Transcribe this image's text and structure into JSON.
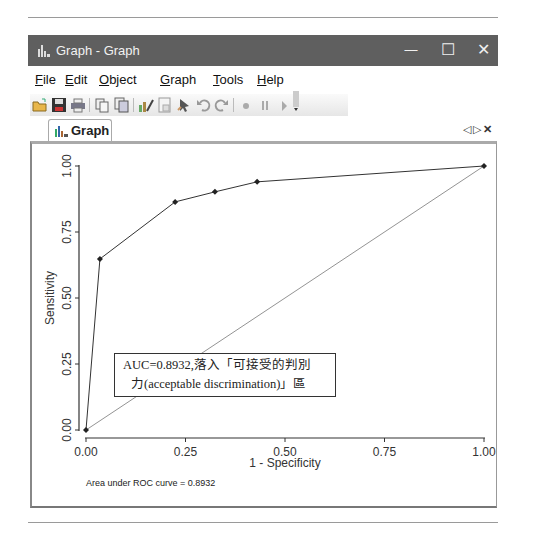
{
  "window": {
    "title": "Graph - Graph",
    "controls": {
      "minimize": "—",
      "maximize": "☐",
      "close": "✕"
    }
  },
  "menu": {
    "items": [
      {
        "label": "File",
        "mnemonic": "F",
        "rest": "ile"
      },
      {
        "label": "Edit",
        "mnemonic": "E",
        "rest": "dit"
      },
      {
        "label": "Object",
        "mnemonic": "O",
        "rest": "bject"
      },
      {
        "label": "Graph",
        "mnemonic": "G",
        "rest": "raph"
      },
      {
        "label": "Tools",
        "mnemonic": "T",
        "rest": "ools"
      },
      {
        "label": "Help",
        "mnemonic": "H",
        "rest": "elp"
      }
    ]
  },
  "toolbar": {
    "buttons": [
      "open-icon",
      "save-icon",
      "print-icon",
      "copy-icon",
      "copy-graph-icon",
      "graph-editor-icon",
      "properties-icon",
      "pointer-icon",
      "undo-icon",
      "redo-icon",
      "record-icon",
      "pause-icon",
      "play-icon",
      "toolbar-options-icon"
    ]
  },
  "tabs": {
    "active": "Graph",
    "nav": {
      "prev": "◁",
      "next": "▷",
      "close": "✕"
    }
  },
  "annotation": {
    "line1": "AUC=0.8932,落入「可接受的判別",
    "line2": "力(acceptable discrimination)」區"
  },
  "chart_data": {
    "type": "line",
    "title": "",
    "xlabel": "1 - Specificity",
    "ylabel": "Sensitivity",
    "xlim": [
      0,
      1
    ],
    "ylim": [
      0,
      1
    ],
    "xticks": [
      "0.00",
      "0.25",
      "0.50",
      "0.75",
      "1.00"
    ],
    "yticks": [
      "0.00",
      "0.25",
      "0.50",
      "0.75",
      "1.00"
    ],
    "grid": false,
    "series": [
      {
        "name": "ROC curve",
        "x": [
          0.0,
          0.035,
          0.224,
          0.324,
          0.43,
          1.0
        ],
        "y": [
          0.0,
          0.648,
          0.864,
          0.902,
          0.94,
          1.0
        ]
      },
      {
        "name": "Reference line",
        "x": [
          0,
          1
        ],
        "y": [
          0,
          1
        ]
      }
    ],
    "note": "Area under ROC curve = 0.8932"
  },
  "colors": {
    "titlebar": "#5f5f5f",
    "curve": "#333333",
    "reference": "#666666"
  }
}
